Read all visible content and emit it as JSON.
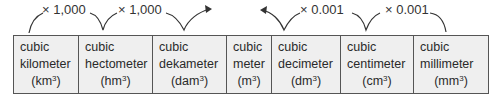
{
  "multipliers": {
    "up": [
      "× 1,000",
      "× 1,000"
    ],
    "down": [
      "× 0.001",
      "× 0.001"
    ]
  },
  "units": [
    {
      "line1": "cubic",
      "line2": "kilometer",
      "abbr": "km",
      "exp": "3"
    },
    {
      "line1": "cubic",
      "line2": "hectometer",
      "abbr": "hm",
      "exp": "3"
    },
    {
      "line1": "cubic",
      "line2": "dekameter",
      "abbr": "dam",
      "exp": "3"
    },
    {
      "line1": "cubic",
      "line2": "meter",
      "abbr": "m",
      "exp": "3"
    },
    {
      "line1": "cubic",
      "line2": "decimeter",
      "abbr": "dm",
      "exp": "3"
    },
    {
      "line1": "cubic",
      "line2": "centimeter",
      "abbr": "cm",
      "exp": "3"
    },
    {
      "line1": "cubic",
      "line2": "millimeter",
      "abbr": "mm",
      "exp": "3"
    }
  ]
}
